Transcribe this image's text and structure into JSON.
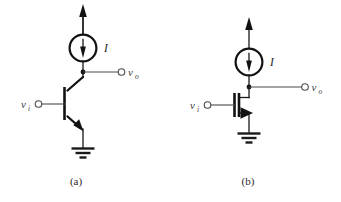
{
  "figure": {
    "background_color": "#ffffff",
    "wire_color": "#4a4a4a",
    "device_color": "#121212",
    "text_color": "#3d3d3d",
    "width": 341,
    "height": 202
  },
  "circuits": [
    {
      "id": "a",
      "caption": "(a)",
      "device_type": "npn-bjt",
      "input_label": "v",
      "input_subscript": "i",
      "output_label": "v",
      "output_subscript": "o",
      "source_label": "I",
      "source_type": "current-source",
      "source_arrow_direction": "down",
      "supply_arrow_direction": "up",
      "has_ground": true
    },
    {
      "id": "b",
      "caption": "(b)",
      "device_type": "nmos-fet",
      "input_label": "v",
      "input_subscript": "i",
      "output_label": "v",
      "output_subscript": "o",
      "source_label": "I",
      "source_type": "current-source",
      "source_arrow_direction": "down",
      "supply_arrow_direction": "up",
      "has_ground": true
    }
  ]
}
